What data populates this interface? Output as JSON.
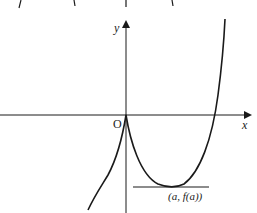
{
  "diagram": {
    "type": "function-graph",
    "axes": {
      "x_label": "x",
      "y_label": "y",
      "origin_label": "O"
    },
    "annotations": {
      "minimum_point_label": "(a, f(a))"
    },
    "colors": {
      "stroke": "#1a1a1a",
      "background": "#ffffff"
    }
  }
}
